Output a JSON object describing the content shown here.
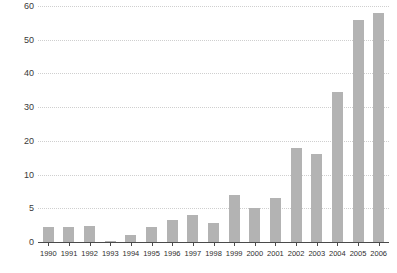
{
  "chart_data": {
    "type": "bar",
    "title": "",
    "subtitle": "",
    "xlabel": "",
    "ylabel": "",
    "categories": [
      "1990",
      "1991",
      "1992",
      "1993",
      "1994",
      "1995",
      "1996",
      "1997",
      "1998",
      "1999",
      "2000",
      "2001",
      "2002",
      "2003",
      "2004",
      "2005",
      "2006"
    ],
    "values": [
      2.2,
      2.2,
      2.4,
      0.2,
      1.1,
      2.3,
      3.2,
      4.0,
      2.8,
      7.0,
      5.0,
      6.5,
      18.0,
      16.0,
      34.5,
      56.0,
      58.0
    ],
    "series": [
      {
        "name": "",
        "values": [
          2.2,
          2.2,
          2.4,
          0.2,
          1.1,
          2.3,
          3.2,
          4.0,
          2.8,
          7.0,
          5.0,
          6.5,
          18.0,
          16.0,
          34.5,
          56.0,
          58.0
        ]
      }
    ],
    "ytick_values": [
      0,
      5,
      10,
      20,
      30,
      40,
      50,
      60
    ],
    "ytick_labels": [
      "0",
      "5",
      "10",
      "20",
      "30",
      "40",
      "50",
      "60"
    ],
    "yaxis_scale": "broken-nonlinear-equal-spacing",
    "ylim": [
      0,
      60
    ],
    "grid": true,
    "grid_style": "dotted-horizontal",
    "legend": false,
    "legend_position": "none",
    "annotations": []
  },
  "style": {
    "bar_color": "#b3b3b3",
    "grid_color": "#cfcfcf",
    "axis_color": "#4a4a4a",
    "tick_label_color": "#3a3a3a",
    "background": "#ffffff"
  }
}
